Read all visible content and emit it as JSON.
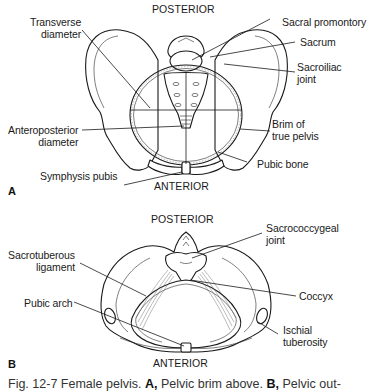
{
  "figure": {
    "caption": {
      "prefix": "Fig. 12-7",
      "title": "Female pelvis.",
      "a_letter": "A,",
      "a_text": "Pelvic brim above.",
      "b_letter": "B,",
      "b_text": "Pelvic out-"
    }
  },
  "panel_a": {
    "letter": "A",
    "orientation_top": "POSTERIOR",
    "orientation_bottom": "ANTERIOR",
    "labels": {
      "transverse_diameter": [
        "Transverse",
        "diameter"
      ],
      "anteroposterior_diameter": [
        "Anteroposterior",
        "diameter"
      ],
      "symphysis_pubis": "Symphysis pubis",
      "sacral_promontory": "Sacral promontory",
      "sacrum": "Sacrum",
      "sacroiliac_joint": [
        "Sacroiliac",
        "joint"
      ],
      "brim_of_true_pelvis": [
        "Brim of",
        "true pelvis"
      ],
      "pubic_bone": "Pubic bone"
    }
  },
  "panel_b": {
    "letter": "B",
    "orientation_top": "POSTERIOR",
    "orientation_bottom": "ANTERIOR",
    "labels": {
      "sacrotuberous_ligament": [
        "Sacrotuberous",
        "ligament"
      ],
      "pubic_arch": "Pubic arch",
      "sacrococcygeal_joint": [
        "Sacrococcygeal",
        "joint"
      ],
      "coccyx": "Coccyx",
      "ischial_tuberosity": [
        "Ischial",
        "tuberosity"
      ]
    }
  }
}
